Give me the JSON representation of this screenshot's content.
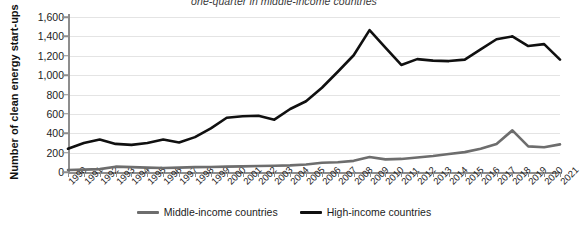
{
  "chart_data": {
    "type": "line",
    "title": "",
    "subtitle": "one-quarter in middle-income countries",
    "xlabel": "",
    "ylabel": "Number of clean energy start-ups",
    "ylim": [
      0,
      1600
    ],
    "yticks": [
      "0",
      "200",
      "400",
      "600",
      "800",
      "1,000",
      "1,200",
      "1,400",
      "1,600"
    ],
    "ytick_values": [
      0,
      200,
      400,
      600,
      800,
      1000,
      1200,
      1400,
      1600
    ],
    "grid": true,
    "legend_position": "bottom",
    "categories": [
      "1990",
      "1991",
      "1992",
      "1993",
      "1994",
      "1995",
      "1996",
      "1997",
      "1998",
      "1999",
      "2000",
      "2001",
      "2002",
      "2003",
      "2004",
      "2005",
      "2006",
      "2007",
      "2008",
      "2009",
      "2010",
      "2011",
      "2012",
      "2013",
      "2014",
      "2015",
      "2016",
      "2017",
      "2018",
      "2019",
      "2020",
      "2021"
    ],
    "series": [
      {
        "name": "Middle-income countries",
        "color": "#6d6d6d",
        "values": [
          20,
          25,
          30,
          55,
          50,
          45,
          42,
          45,
          50,
          52,
          55,
          58,
          62,
          65,
          68,
          78,
          95,
          100,
          115,
          155,
          130,
          135,
          150,
          165,
          185,
          205,
          240,
          290,
          430,
          265,
          255,
          285
        ]
      },
      {
        "name": "High-income countries",
        "color": "#101010",
        "values": [
          240,
          300,
          335,
          290,
          280,
          300,
          335,
          305,
          360,
          450,
          560,
          575,
          580,
          540,
          650,
          730,
          870,
          1035,
          1205,
          1465,
          1285,
          1105,
          1165,
          1150,
          1145,
          1160,
          1265,
          1370,
          1400,
          1300,
          1320,
          1160
        ]
      }
    ]
  },
  "legend": {
    "items": [
      {
        "label": "Middle-income countries",
        "color": "#6d6d6d"
      },
      {
        "label": "High-income countries",
        "color": "#101010"
      }
    ]
  }
}
